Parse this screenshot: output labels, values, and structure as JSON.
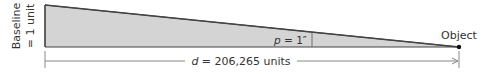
{
  "diagram": {
    "baseline_label_line1": "Baseline",
    "baseline_label_line2": "= 1 unit",
    "angle_symbol": "p",
    "angle_value": " = 1″",
    "distance_symbol": "d",
    "distance_value": " = 206,265 units",
    "object_label": "Object",
    "colors": {
      "triangle_fill": "#d4d4d4",
      "stroke": "#444444",
      "dimension_line": "#888888",
      "point": "#111111"
    }
  }
}
